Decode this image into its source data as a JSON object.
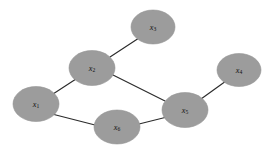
{
  "figure": {
    "name": "undirected-graph",
    "type": "node-link-diagram",
    "width": 278,
    "height": 153,
    "background_color": "#ffffff",
    "node_fill_color": "#9c9c9c",
    "node_stroke_color": "#949494",
    "edge_color": "#2b2b2b",
    "label_color": "#111111"
  },
  "nodes": [
    {
      "id": "x1",
      "base": "x",
      "sub": "1",
      "label": "x1",
      "cx": 36,
      "cy": 104,
      "rx": 23,
      "ry": 17.5
    },
    {
      "id": "x2",
      "base": "x",
      "sub": "2",
      "label": "x2",
      "cx": 92,
      "cy": 68,
      "rx": 23,
      "ry": 17.5
    },
    {
      "id": "x3",
      "base": "x",
      "sub": "3",
      "label": "x3",
      "cx": 153,
      "cy": 27,
      "rx": 22,
      "ry": 17.0
    },
    {
      "id": "x4",
      "base": "x",
      "sub": "4",
      "label": "x4",
      "cx": 239,
      "cy": 70,
      "rx": 22,
      "ry": 16.5
    },
    {
      "id": "x5",
      "base": "x",
      "sub": "5",
      "label": "x5",
      "cx": 185,
      "cy": 110,
      "rx": 23,
      "ry": 17.5
    },
    {
      "id": "x6",
      "base": "x",
      "sub": "6",
      "label": "x6",
      "cx": 117,
      "cy": 127,
      "rx": 23,
      "ry": 17.0
    }
  ],
  "edges": [
    {
      "id": "edge-x2-x3",
      "source": "x2",
      "target": "x3",
      "x1": 110,
      "y1": 57,
      "x2": 139,
      "y2": 38
    },
    {
      "id": "edge-x1-x2",
      "source": "x1",
      "target": "x2",
      "x1": 53,
      "y1": 94,
      "x2": 76,
      "y2": 79
    },
    {
      "id": "edge-x2-x5",
      "source": "x2",
      "target": "x5",
      "x1": 113,
      "y1": 75,
      "x2": 165,
      "y2": 101
    },
    {
      "id": "edge-x1-x6",
      "source": "x1",
      "target": "x6",
      "x1": 52,
      "y1": 114,
      "x2": 95,
      "y2": 125
    },
    {
      "id": "edge-x6-x5",
      "source": "x6",
      "target": "x5",
      "x1": 139,
      "y1": 124,
      "x2": 167,
      "y2": 117
    },
    {
      "id": "edge-x5-x4",
      "source": "x5",
      "target": "x4",
      "x1": 201,
      "y1": 99,
      "x2": 226,
      "y2": 81
    }
  ]
}
